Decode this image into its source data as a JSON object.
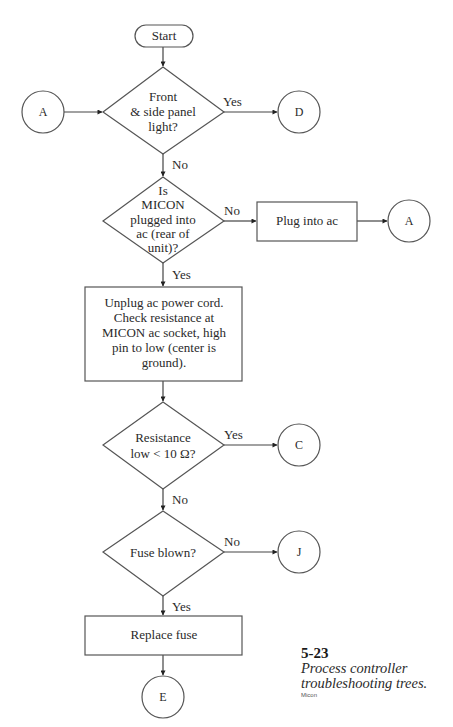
{
  "diagram": {
    "type": "flowchart",
    "nodes": {
      "start": {
        "label": "Start"
      },
      "d1": {
        "lines": [
          "Front",
          "& side panel",
          "light?"
        ]
      },
      "d2": {
        "lines": [
          "Is",
          "MICON",
          "plugged into",
          "ac (rear of",
          "unit)?"
        ]
      },
      "p1": {
        "label": "Plug into ac"
      },
      "p2": {
        "lines": [
          "Unplug ac power cord.",
          "Check resistance at",
          "MICON ac socket, high",
          "pin to low (center is",
          "ground)."
        ]
      },
      "d3": {
        "lines": [
          "Resistance",
          "low < 10 Ω?"
        ]
      },
      "d4": {
        "label": "Fuse blown?"
      },
      "p3": {
        "label": "Replace fuse"
      },
      "connA_in": {
        "label": "A"
      },
      "connD": {
        "label": "D"
      },
      "connA_out": {
        "label": "A"
      },
      "connC": {
        "label": "C"
      },
      "connJ": {
        "label": "J"
      },
      "connE": {
        "label": "E"
      }
    },
    "edge_labels": {
      "d1_yes": "Yes",
      "d1_no": "No",
      "d2_no": "No",
      "d2_yes": "Yes",
      "d3_yes": "Yes",
      "d3_no": "No",
      "d4_no": "No",
      "d4_yes": "Yes"
    },
    "edges": [
      {
        "from": "Start",
        "to": "Front & side panel light?"
      },
      {
        "from": "A",
        "to": "Front & side panel light?"
      },
      {
        "from": "Front & side panel light?",
        "to": "D",
        "label": "Yes"
      },
      {
        "from": "Front & side panel light?",
        "to": "Is MICON plugged into ac (rear of unit)?",
        "label": "No"
      },
      {
        "from": "Is MICON plugged into ac (rear of unit)?",
        "to": "Plug into ac",
        "label": "No"
      },
      {
        "from": "Plug into ac",
        "to": "A"
      },
      {
        "from": "Is MICON plugged into ac (rear of unit)?",
        "to": "Unplug ac power cord...",
        "label": "Yes"
      },
      {
        "from": "Unplug ac power cord...",
        "to": "Resistance low < 10 Ω?"
      },
      {
        "from": "Resistance low < 10 Ω?",
        "to": "C",
        "label": "Yes"
      },
      {
        "from": "Resistance low < 10 Ω?",
        "to": "Fuse blown?",
        "label": "No"
      },
      {
        "from": "Fuse blown?",
        "to": "J",
        "label": "No"
      },
      {
        "from": "Fuse blown?",
        "to": "Replace fuse",
        "label": "Yes"
      },
      {
        "from": "Replace fuse",
        "to": "E"
      }
    ]
  },
  "caption": {
    "number": "5-23",
    "title_lines": [
      "Process controller",
      "troubleshooting trees."
    ],
    "source": "Micon"
  }
}
